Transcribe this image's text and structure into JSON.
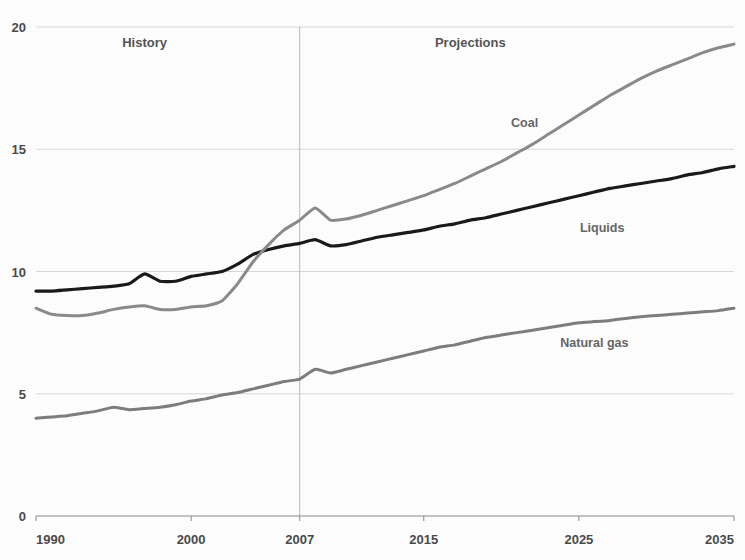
{
  "figure": {
    "clipped_top_text": "",
    "background_color": "#fdfdfd"
  },
  "annotations": {
    "history_label": "History",
    "projections_label": "Projections",
    "divider_year": 2007
  },
  "chart_data": {
    "type": "line",
    "title": "",
    "subtitle": "",
    "xlabel": "",
    "ylabel": "",
    "xlim": [
      1990,
      2035
    ],
    "ylim": [
      0,
      20
    ],
    "xticks": [
      1990,
      2000,
      2007,
      2015,
      2025,
      2035
    ],
    "xtick_labels": [
      "1990",
      "2000",
      "2007",
      "2015",
      "2025",
      "2035"
    ],
    "yticks": [
      0,
      5,
      10,
      15,
      20
    ],
    "ytick_labels": [
      "0",
      "5",
      "10",
      "15",
      "20"
    ],
    "grid": "horizontal",
    "legend_position": "inline-annotations",
    "annotations": [
      {
        "text": "History",
        "x": 1997,
        "y": 19.2
      },
      {
        "text": "Projections",
        "x": 2018,
        "y": 19.2
      },
      {
        "text": "Coal",
        "x": 2021.5,
        "y": 15.9
      },
      {
        "text": "Liquids",
        "x": 2026.5,
        "y": 11.6
      },
      {
        "text": "Natural gas",
        "x": 2026.0,
        "y": 6.9
      }
    ],
    "series": [
      {
        "name": "Liquids",
        "color": "#1a1a1a",
        "width": 3.2,
        "x": [
          1990,
          1991,
          1992,
          1993,
          1994,
          1995,
          1996,
          1997,
          1998,
          1999,
          2000,
          2001,
          2002,
          2003,
          2004,
          2005,
          2006,
          2007,
          2008,
          2009,
          2010,
          2011,
          2012,
          2013,
          2014,
          2015,
          2016,
          2017,
          2018,
          2019,
          2020,
          2021,
          2022,
          2023,
          2024,
          2025,
          2026,
          2027,
          2028,
          2029,
          2030,
          2031,
          2032,
          2033,
          2034,
          2035
        ],
        "y": [
          9.2,
          9.2,
          9.25,
          9.3,
          9.35,
          9.4,
          9.5,
          9.9,
          9.6,
          9.6,
          9.8,
          9.9,
          10.0,
          10.3,
          10.7,
          10.9,
          11.05,
          11.15,
          11.3,
          11.05,
          11.1,
          11.25,
          11.4,
          11.5,
          11.6,
          11.7,
          11.85,
          11.95,
          12.1,
          12.2,
          12.35,
          12.5,
          12.65,
          12.8,
          12.95,
          13.1,
          13.25,
          13.4,
          13.5,
          13.6,
          13.7,
          13.8,
          13.95,
          14.05,
          14.2,
          14.3
        ]
      },
      {
        "name": "Coal",
        "color": "#8a8a8a",
        "width": 3.0,
        "x": [
          1990,
          1991,
          1992,
          1993,
          1994,
          1995,
          1996,
          1997,
          1998,
          1999,
          2000,
          2001,
          2002,
          2003,
          2004,
          2005,
          2006,
          2007,
          2008,
          2009,
          2010,
          2011,
          2012,
          2013,
          2014,
          2015,
          2016,
          2017,
          2018,
          2019,
          2020,
          2021,
          2022,
          2023,
          2024,
          2025,
          2026,
          2027,
          2028,
          2029,
          2030,
          2031,
          2032,
          2033,
          2034,
          2035
        ],
        "y": [
          8.5,
          8.25,
          8.2,
          8.2,
          8.3,
          8.45,
          8.55,
          8.6,
          8.45,
          8.45,
          8.55,
          8.6,
          8.8,
          9.5,
          10.4,
          11.1,
          11.7,
          12.1,
          12.6,
          12.1,
          12.15,
          12.3,
          12.5,
          12.7,
          12.9,
          13.1,
          13.35,
          13.6,
          13.9,
          14.2,
          14.5,
          14.85,
          15.2,
          15.6,
          16.0,
          16.4,
          16.8,
          17.2,
          17.55,
          17.9,
          18.2,
          18.45,
          18.7,
          18.95,
          19.15,
          19.3
        ]
      },
      {
        "name": "Natural gas",
        "color": "#7d7d7d",
        "width": 3.0,
        "x": [
          1990,
          1991,
          1992,
          1993,
          1994,
          1995,
          1996,
          1997,
          1998,
          1999,
          2000,
          2001,
          2002,
          2003,
          2004,
          2005,
          2006,
          2007,
          2008,
          2009,
          2010,
          2011,
          2012,
          2013,
          2014,
          2015,
          2016,
          2017,
          2018,
          2019,
          2020,
          2021,
          2022,
          2023,
          2024,
          2025,
          2026,
          2027,
          2028,
          2029,
          2030,
          2031,
          2032,
          2033,
          2034,
          2035
        ],
        "y": [
          4.0,
          4.05,
          4.1,
          4.2,
          4.3,
          4.45,
          4.35,
          4.4,
          4.45,
          4.55,
          4.7,
          4.8,
          4.95,
          5.05,
          5.2,
          5.35,
          5.5,
          5.6,
          6.0,
          5.85,
          6.0,
          6.15,
          6.3,
          6.45,
          6.6,
          6.75,
          6.9,
          7.0,
          7.15,
          7.3,
          7.4,
          7.5,
          7.6,
          7.7,
          7.8,
          7.9,
          7.95,
          8.0,
          8.08,
          8.15,
          8.2,
          8.25,
          8.3,
          8.35,
          8.4,
          8.5
        ]
      }
    ]
  }
}
